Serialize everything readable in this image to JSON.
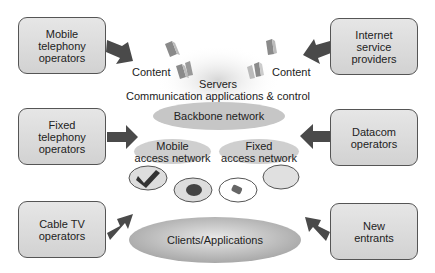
{
  "diagram": {
    "left_boxes": [
      {
        "label": "Mobile\ntelephony\noperators"
      },
      {
        "label": "Fixed\ntelephony\noperators"
      },
      {
        "label": "Cable TV\noperators"
      }
    ],
    "right_boxes": [
      {
        "label": "Internet\nservice\nproviders"
      },
      {
        "label": "Datacom\noperators"
      },
      {
        "label": "New\nentrants"
      }
    ],
    "center": {
      "content_left": "Content",
      "content_right": "Content",
      "servers": "Servers",
      "servers_sub": "Communication applications & control",
      "backbone": "Backbone network",
      "mobile_access": "Mobile\naccess network",
      "fixed_access": "Fixed\naccess network",
      "clients": "Clients/Applications"
    },
    "devices": [
      "mobile-phone-icon",
      "mouse-icon",
      "handheld-device-icon",
      "empty-device"
    ],
    "colors": {
      "box_fill": "#dcdcdc",
      "arrow": "#4a4a4a",
      "ellipse": "#c4c4c4",
      "text": "#222222"
    }
  }
}
